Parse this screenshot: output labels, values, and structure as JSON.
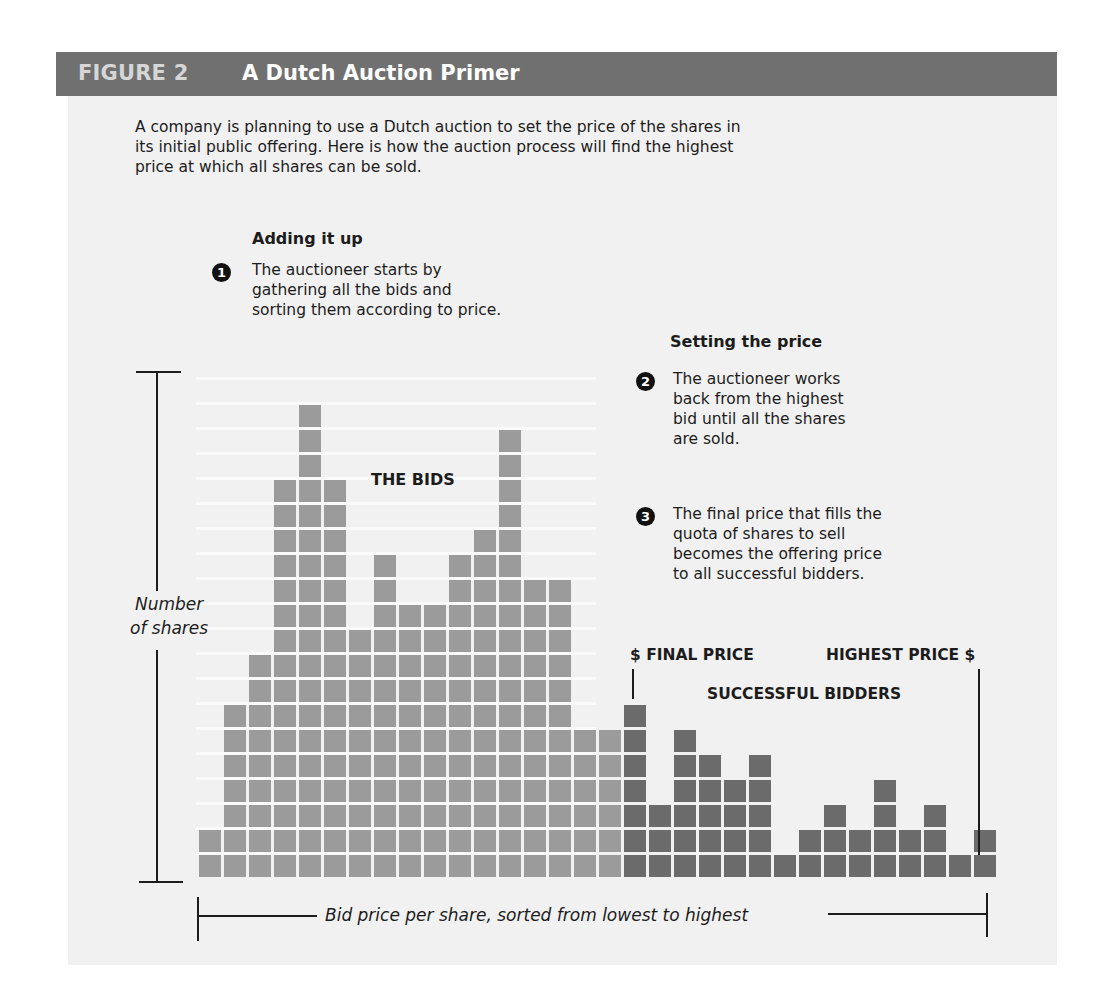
{
  "header": {
    "figure_label": "FIGURE 2",
    "title": "A Dutch Auction Primer"
  },
  "intro": {
    "lines": [
      "A company is planning to use a Dutch auction to set the price of the shares in",
      "its initial public offering. Here is how the auction process will find the highest",
      "price at which all shares can be sold."
    ]
  },
  "adding_it_up": {
    "title": "Adding it up",
    "step_number": "1",
    "lines": [
      "The auctioneer starts by",
      "gathering all the bids and",
      "sorting them according to price."
    ]
  },
  "setting_the_price": {
    "title": "Setting the price",
    "steps": [
      {
        "number": "2",
        "lines": [
          "The auctioneer works",
          "back from the highest",
          "bid until all the shares",
          "are sold."
        ]
      },
      {
        "number": "3",
        "lines": [
          "The final price that fills the",
          "quota of shares to sell",
          "becomes the offering price",
          "to all successful bidders."
        ]
      }
    ]
  },
  "chart_labels": {
    "bids": "THE BIDS",
    "final_price": "$ FINAL PRICE",
    "highest_price": "HIGHEST PRICE $",
    "successful_bidders": "SUCCESSFUL BIDDERS",
    "y_axis_line1": "Number",
    "y_axis_line2": "of shares",
    "x_axis": "Bid price per share, sorted from lowest to highest"
  },
  "colors": {
    "header_bg": "#707070",
    "panel_bg": "#f1f1f1",
    "bid_cell": "#9b9b9b",
    "successful_cell": "#6b6b6b"
  },
  "chart_data": {
    "type": "bar",
    "title": "A Dutch Auction Primer",
    "xlabel": "Bid price per share, sorted from lowest to highest",
    "ylabel": "Number of shares",
    "categories": [
      "1",
      "2",
      "3",
      "4",
      "5",
      "6",
      "7",
      "8",
      "9",
      "10",
      "11",
      "12",
      "13",
      "14",
      "15",
      "16",
      "17",
      "18",
      "19",
      "20",
      "21",
      "22",
      "23",
      "24",
      "25",
      "26",
      "27",
      "28",
      "29",
      "30",
      "31",
      "32"
    ],
    "values": [
      2,
      7,
      9,
      16,
      19,
      16,
      10,
      13,
      11,
      11,
      13,
      14,
      18,
      12,
      12,
      6,
      6,
      7,
      3,
      6,
      5,
      4,
      5,
      1,
      2,
      3,
      2,
      4,
      2,
      3,
      1,
      2
    ],
    "series": [
      {
        "name": "Bids (unsuccessful)",
        "range": [
          1,
          17
        ]
      },
      {
        "name": "Successful bidders",
        "range": [
          18,
          32
        ]
      }
    ],
    "final_price_column": 18,
    "highest_price_column": 32,
    "ylim": [
      0,
      19
    ],
    "grid": false,
    "annotations": [
      "THE BIDS",
      "$ FINAL PRICE",
      "HIGHEST PRICE $",
      "SUCCESSFUL BIDDERS"
    ]
  }
}
